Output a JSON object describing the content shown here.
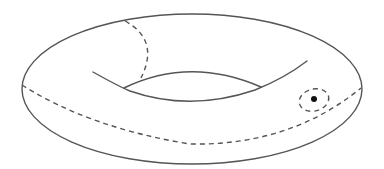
{
  "figure": {
    "background": "#ffffff",
    "stroke_color": "#555555",
    "elements": [
      {
        "name": "outer-boundary",
        "style": "solid"
      },
      {
        "name": "inner-hole-lower-curve",
        "style": "solid"
      },
      {
        "name": "inner-hole-upper-curve",
        "style": "solid"
      },
      {
        "name": "meridian-loop",
        "style": "dashed"
      },
      {
        "name": "longitude-loop",
        "style": "dashed"
      },
      {
        "name": "small-loop-around-point",
        "style": "dashed"
      },
      {
        "name": "marked-point",
        "style": "filled-dot"
      }
    ]
  }
}
